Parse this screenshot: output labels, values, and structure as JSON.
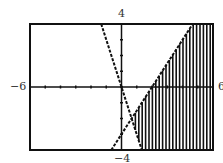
{
  "chart_data": {
    "type": "line",
    "title": "",
    "xlabel": "",
    "ylabel": "",
    "xlim": [
      -6,
      6
    ],
    "ylim": [
      -4,
      4
    ],
    "tick_labels": {
      "xmin": "−6",
      "xmax": "6",
      "ymax": "4",
      "ymin": "−4"
    },
    "grid": false,
    "series": [
      {
        "name": "boundary-1",
        "equation": "y = -3x",
        "style": "dashed",
        "points": [
          [
            -1.33,
            4
          ],
          [
            1.33,
            -4
          ]
        ]
      },
      {
        "name": "boundary-2",
        "equation": "y = 1.5x - 3",
        "style": "dashed",
        "points": [
          [
            -0.67,
            -4
          ],
          [
            4.67,
            4
          ]
        ]
      }
    ],
    "shaded_region": {
      "description": "y >= -3x and y <= 1.5x - 3",
      "pattern": "vertical-lines"
    },
    "x_ticks": [
      -6,
      -5,
      -4,
      -3,
      -2,
      -1,
      0,
      1,
      2,
      3,
      4,
      5,
      6
    ],
    "y_ticks": [
      -4,
      -3,
      -2,
      -1,
      0,
      1,
      2,
      3,
      4
    ]
  }
}
